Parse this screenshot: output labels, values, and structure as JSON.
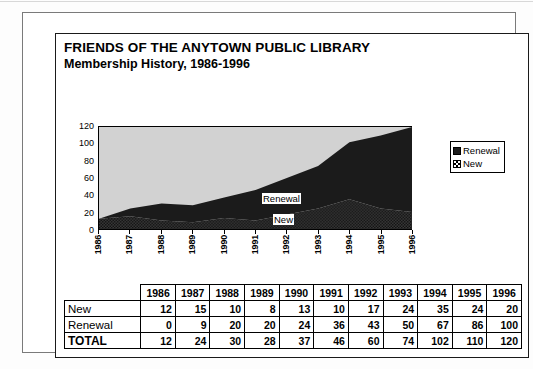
{
  "document": {
    "title_main": "FRIENDS OF THE ANYTOWN PUBLIC LIBRARY",
    "title_sub": "Membership History, 1986-1996"
  },
  "chart": {
    "legend": {
      "items": [
        {
          "label": "Renewal",
          "swatch": "solid-black",
          "color": "#1c1c1c"
        },
        {
          "label": "New",
          "swatch": "checkered",
          "color": "#000000"
        }
      ]
    },
    "inchart_labels": [
      {
        "text": "Renewal"
      },
      {
        "text": "New"
      }
    ],
    "plot_background": "#d2d2d2"
  },
  "chart_data": {
    "type": "area",
    "title": "Membership History, 1986-1996",
    "xlabel": "",
    "ylabel": "",
    "x": [
      "1986",
      "1987",
      "1988",
      "1989",
      "1990",
      "1991",
      "1992",
      "1993",
      "1994",
      "1995",
      "1996"
    ],
    "categories": [
      "1986",
      "1987",
      "1988",
      "1989",
      "1990",
      "1991",
      "1992",
      "1993",
      "1994",
      "1995",
      "1996"
    ],
    "stacked": true,
    "series": [
      {
        "name": "New",
        "values": [
          12,
          15,
          10,
          8,
          13,
          10,
          17,
          24,
          35,
          24,
          20
        ]
      },
      {
        "name": "Renewal",
        "values": [
          0,
          9,
          20,
          20,
          24,
          36,
          43,
          50,
          67,
          86,
          100
        ]
      }
    ],
    "ylim": [
      0,
      120
    ],
    "yticks": [
      0,
      20,
      40,
      60,
      80,
      100,
      120
    ],
    "grid": false,
    "legend_position": "right"
  },
  "table": {
    "corner_label": "",
    "year_headers": [
      "1986",
      "1987",
      "1988",
      "1989",
      "1990",
      "1991",
      "1992",
      "1993",
      "1994",
      "1995",
      "1996"
    ],
    "rows": [
      {
        "label": "New",
        "values": [
          12,
          15,
          10,
          8,
          13,
          10,
          17,
          24,
          35,
          24,
          20
        ]
      },
      {
        "label": "Renewal",
        "values": [
          0,
          9,
          20,
          20,
          24,
          36,
          43,
          50,
          67,
          86,
          100
        ]
      },
      {
        "label": "TOTAL",
        "values": [
          12,
          24,
          30,
          28,
          37,
          46,
          60,
          74,
          102,
          110,
          120
        ]
      }
    ]
  }
}
